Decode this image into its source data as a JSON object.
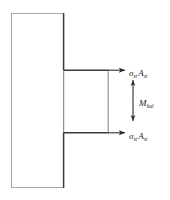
{
  "figure": {
    "type": "free-body-diagram",
    "background_color": "#ffffff",
    "line_color": "#3a3a3a",
    "line_color_light": "#9a9a9a",
    "text_color": "#1a1a1a"
  },
  "shapes": {
    "column": {
      "name": "vertical-member",
      "x": 11,
      "y": 13,
      "width": 53,
      "height": 175
    },
    "flange_block": {
      "name": "flange-block",
      "x": 64,
      "y": 70,
      "width": 44,
      "height": 63
    }
  },
  "arrows": {
    "force_top": {
      "name": "force-arrow-top",
      "direction": "right",
      "x1": 64,
      "y1": 70,
      "x2": 126,
      "y2": 70
    },
    "force_bottom": {
      "name": "force-arrow-bottom",
      "direction": "right",
      "x1": 64,
      "y1": 133,
      "x2": 126,
      "y2": 133
    },
    "moment": {
      "name": "moment-arrow",
      "direction": "vertical-double",
      "x": 133,
      "y1": 79,
      "y2": 122
    }
  },
  "labels": {
    "force_top": {
      "name": "force-label-top",
      "symbol": "σ",
      "symbol_subscript": "st",
      "area_symbol": "A",
      "area_subscript": "st",
      "full_text": "σst Ast"
    },
    "force_bottom": {
      "name": "force-label-bottom",
      "symbol": "σ",
      "symbol_subscript": "st",
      "area_symbol": "A",
      "area_subscript": "st",
      "full_text": "σst Ast"
    },
    "moment": {
      "name": "moment-label",
      "symbol": "M",
      "subscript": "bal",
      "full_text": "Mbal"
    }
  }
}
